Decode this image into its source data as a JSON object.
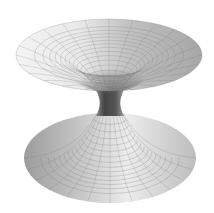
{
  "figure": {
    "colors": {
      "background": "#ffffff",
      "surface_light": "#f2f2f2",
      "surface_mid": "#b5b5b5",
      "surface_dark": "#6a6a6a",
      "throat": "#4a4a4a",
      "grid_line": "#7a7a7a"
    },
    "mesh": {
      "rings_per_funnel": 14,
      "radial_lines": 24
    }
  }
}
